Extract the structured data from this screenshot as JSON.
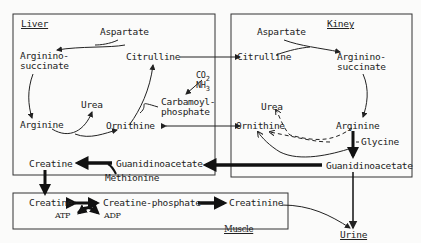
{
  "regions": {
    "liver": "Liver",
    "kidney": "Kiney",
    "muscle": "Muscle"
  },
  "liver": {
    "aspartate": "Aspartate",
    "argininosuccinate_1": "Arginino-",
    "argininosuccinate_2": "succinate",
    "citrulline": "Citrulline",
    "co2": "CO2",
    "nh3": "NH3",
    "carbamoyl_1": "Carbamoyl-",
    "carbamoyl_2": "phosphate",
    "urea": "Urea",
    "arginine": "Arginine",
    "ornithine": "Ornithine",
    "creatine": "Creatine",
    "guanidinoacetate": "Guanidinoacetate",
    "methionine": "Methionine"
  },
  "kidney": {
    "aspartate": "Aspartate",
    "citrulline": "Citrulline",
    "argininosuccinate_1": "Arginino-",
    "argininosuccinate_2": "succinate",
    "urea": "Urea",
    "ornithine": "Ornithine",
    "arginine": "Arginine",
    "glycine": "Glycine",
    "guanidinoacetate": "Guanidinoacetate"
  },
  "muscle": {
    "creatine": "Creatine",
    "atp": "ATP",
    "creatine_phosphate": "Creatine-phosphate",
    "adp": "ADP",
    "creatinine": "Creatinine"
  },
  "outside": {
    "urine": "Urine"
  }
}
